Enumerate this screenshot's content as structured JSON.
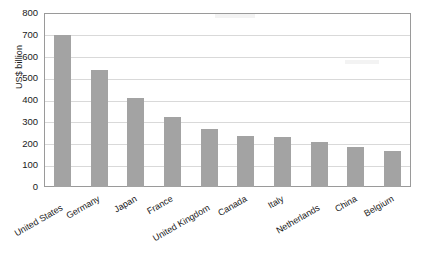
{
  "chart_data": {
    "type": "bar",
    "title": "",
    "xlabel": "",
    "ylabel": "US$ billion",
    "ylim": [
      0,
      800
    ],
    "yticks": [
      0,
      100,
      200,
      300,
      400,
      500,
      600,
      700,
      800
    ],
    "grid": true,
    "legend": "none",
    "bar_color": "#a3a3a3",
    "categories": [
      "United States",
      "Germany",
      "Japan",
      "France",
      "United Kingdom",
      "Canada",
      "Italy",
      "Netherlands",
      "China",
      "Belgium"
    ],
    "values": [
      700,
      540,
      410,
      320,
      265,
      235,
      228,
      208,
      183,
      165
    ]
  }
}
